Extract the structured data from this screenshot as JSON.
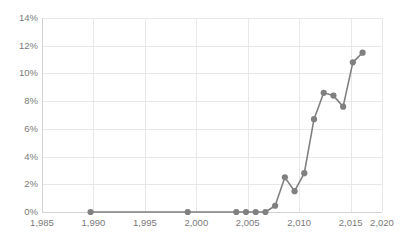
{
  "chart_data": {
    "type": "line",
    "title": "",
    "subtitle": "",
    "xlabel": "",
    "ylabel": "",
    "xlim": [
      1985,
      2020
    ],
    "ylim": [
      0,
      14
    ],
    "grid": true,
    "legend": false,
    "legend_position": "none",
    "y_tick_labels": [
      "0%",
      "2%",
      "4%",
      "6%",
      "8%",
      "10%",
      "12%",
      "14%"
    ],
    "y_tick_values": [
      0,
      2,
      4,
      6,
      8,
      10,
      12,
      14
    ],
    "x_tick_labels": [
      "1,985",
      "1,990",
      "1,995",
      "2,000",
      "2,005",
      "2,010",
      "2,015",
      "2,020"
    ],
    "x_tick_values": [
      1985,
      1990,
      1995,
      2000,
      2005,
      2010,
      2015,
      2020
    ],
    "series": [
      {
        "name": "share",
        "color": "#808080",
        "marker": "circle",
        "x": [
          1990,
          2000,
          2005,
          2006,
          2007,
          2008,
          2009,
          2010,
          2011,
          2012,
          2013,
          2014,
          2015,
          2016,
          2017,
          2018
        ],
        "values": [
          0.0,
          0.0,
          0.0,
          0.0,
          0.0,
          0.0,
          0.45,
          2.5,
          1.5,
          2.8,
          6.7,
          8.6,
          8.4,
          7.6,
          10.8,
          11.5
        ]
      }
    ]
  },
  "style": {
    "line_color": "#808080",
    "marker_color": "#808080",
    "grid_color": "#e8e8e8",
    "axis_color": "#d2d2d2",
    "tick_text_color": "#7a7a7a",
    "background": "#ffffff"
  }
}
